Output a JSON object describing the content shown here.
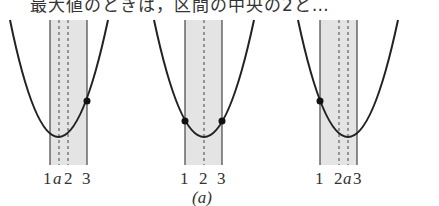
{
  "header": {
    "text": "最大値のときは，区間の中央の2と…"
  },
  "figure": {
    "caption": "(a)",
    "band_color": "#e4e4e4",
    "curve_color": "#222222",
    "panels": [
      {
        "id": "left",
        "description": "axis a lies between 1 and 2; maximum at x=3",
        "tick_labels": [
          "1",
          "a",
          "2",
          "3"
        ],
        "marked_points": [
          "x=3"
        ]
      },
      {
        "id": "center",
        "description": "axis a = 2; maximum at both x=1 and x=3",
        "tick_labels": [
          "1",
          "2",
          "3"
        ],
        "marked_points": [
          "x=1",
          "x=3"
        ]
      },
      {
        "id": "right",
        "description": "axis a lies between 2 and 3; maximum at x=1",
        "tick_labels": [
          "1",
          "2",
          "a",
          "3"
        ],
        "marked_points": [
          "x=1"
        ]
      }
    ]
  }
}
